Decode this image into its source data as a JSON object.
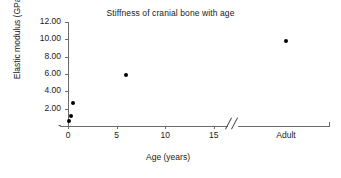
{
  "chart_data": {
    "type": "scatter",
    "title": "Stiffness of cranial bone with age",
    "xlabel": "Age (years)",
    "ylabel": "Elastic modulus (GPa)",
    "grid": false,
    "legend": null,
    "axis_break": {
      "present": true,
      "symbol": "//",
      "between": [
        17,
        19
      ],
      "note": "x-axis broken before the Adult category"
    },
    "xlim": [
      0,
      27
    ],
    "ylim": [
      0,
      12
    ],
    "xticks": [
      {
        "value": 0,
        "label": "0"
      },
      {
        "value": 5,
        "label": "5"
      },
      {
        "value": 10,
        "label": "10"
      },
      {
        "value": 15,
        "label": "15"
      },
      {
        "value": 22.5,
        "label": "Adult"
      }
    ],
    "yticks": [
      {
        "value": 0,
        "label": "-"
      },
      {
        "value": 2,
        "label": "2.00"
      },
      {
        "value": 4,
        "label": "4.00"
      },
      {
        "value": 6,
        "label": "6.00"
      },
      {
        "value": 8,
        "label": "8.00"
      },
      {
        "value": 10,
        "label": "10.00"
      },
      {
        "value": 12,
        "label": "12.00"
      }
    ],
    "series": [
      {
        "name": "Elastic modulus",
        "marker": "filled-circle",
        "color": "#000000",
        "points": [
          {
            "x": 0.1,
            "y": 0.55,
            "xlabel": "0.1",
            "ylabel": "0.55"
          },
          {
            "x": 0.3,
            "y": 1.15,
            "xlabel": "0.3",
            "ylabel": "1.15"
          },
          {
            "x": 0.5,
            "y": 2.6,
            "xlabel": "0.5",
            "ylabel": "2.60"
          },
          {
            "x": 6.0,
            "y": 5.9,
            "xlabel": "6",
            "ylabel": "5.90"
          },
          {
            "x": 22.5,
            "y": 9.8,
            "xlabel": "Adult",
            "ylabel": "9.80"
          }
        ]
      }
    ]
  },
  "colors": {
    "axis": "#6b6b6b",
    "text": "#1a1a1a",
    "marker": "#000000",
    "background": "#ffffff"
  }
}
